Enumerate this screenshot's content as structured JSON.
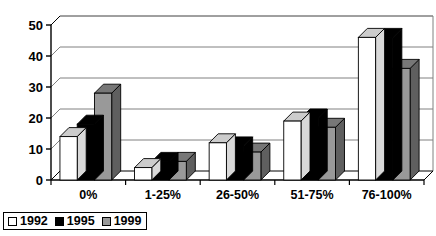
{
  "chart_data": {
    "type": "bar",
    "title": "",
    "subtitle": "",
    "xlabel": "",
    "ylabel": "",
    "categories": [
      "0%",
      "1-25%",
      "26-50%",
      "51-75%",
      "76-100%"
    ],
    "series": [
      {
        "name": "1992",
        "color": "#ffffff",
        "values": [
          14,
          4,
          12,
          19,
          46
        ]
      },
      {
        "name": "1995",
        "color": "#000000",
        "values": [
          18,
          6,
          11,
          20,
          46
        ]
      },
      {
        "name": "1999",
        "color": "#999999",
        "values": [
          28,
          6,
          9,
          17,
          36
        ]
      }
    ],
    "ylim": [
      0,
      50
    ],
    "yticks": [
      0,
      10,
      20,
      30,
      40,
      50
    ],
    "ytick_labels": [
      "0",
      "10",
      "20",
      "30",
      "40",
      "50"
    ],
    "grid": true,
    "grid_axis": "y",
    "legend_position": "bottom-left",
    "style": "3d-bars"
  },
  "legend": {
    "entries": [
      {
        "label": "1992",
        "swatch": "#ffffff"
      },
      {
        "label": "1995",
        "swatch": "#000000"
      },
      {
        "label": "1999",
        "swatch": "#999999"
      }
    ]
  }
}
